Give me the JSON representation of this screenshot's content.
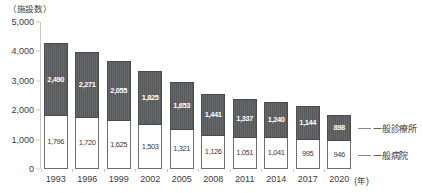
{
  "chart": {
    "axis_title": "（施設数）",
    "x_unit": "(年)",
    "ylabel": "",
    "xlabel": ""
  },
  "legend": {
    "items": [
      {
        "key": "clinics",
        "label": "一般診療所"
      },
      {
        "key": "hospitals",
        "label": "一般病院"
      }
    ]
  },
  "chart_data": {
    "type": "bar",
    "subtype": "stacked",
    "title": "（施設数）",
    "xlabel": "(年)",
    "ylabel": "",
    "ylim": [
      0,
      5000
    ],
    "yticks": [
      0,
      1000,
      2000,
      3000,
      4000,
      5000
    ],
    "ytick_labels": [
      "0",
      "1,000",
      "2,000",
      "3,000",
      "4,000",
      "5,000"
    ],
    "grid": false,
    "legend_position": "right",
    "categories": [
      "1993",
      "1996",
      "1999",
      "2002",
      "2005",
      "2008",
      "2011",
      "2014",
      "2017",
      "2020"
    ],
    "series": [
      {
        "name": "一般病院",
        "key": "hospitals",
        "color": "#ffffff",
        "stack_position": "bottom",
        "values": [
          1796,
          1720,
          1625,
          1503,
          1321,
          1126,
          1051,
          1041,
          995,
          946
        ],
        "value_labels": [
          "1,796",
          "1,720",
          "1,625",
          "1,503",
          "1,321",
          "1,126",
          "1,051",
          "1,041",
          "995",
          "946"
        ]
      },
      {
        "name": "一般診療所",
        "key": "clinics",
        "color": "#57585a",
        "stack_position": "top",
        "values": [
          2490,
          2271,
          2055,
          1825,
          1653,
          1441,
          1337,
          1240,
          1144,
          898
        ],
        "value_labels": [
          "2,490",
          "2,271",
          "2,055",
          "1,825",
          "1,653",
          "1,441",
          "1,337",
          "1,240",
          "1,144",
          "898"
        ]
      }
    ],
    "totals": [
      4286,
      3991,
      3680,
      3328,
      2974,
      2567,
      2388,
      2281,
      2139,
      1844
    ]
  }
}
